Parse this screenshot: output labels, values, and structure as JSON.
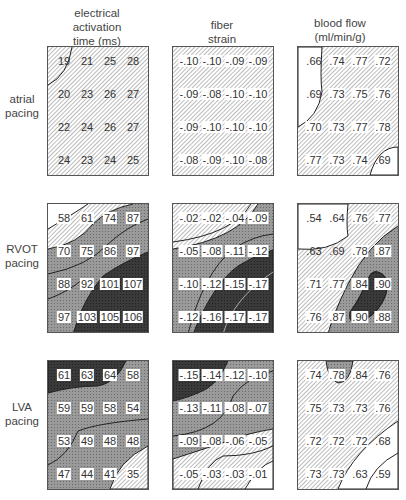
{
  "columns": [
    {
      "title_lines": [
        "electrical",
        "activation",
        "time (ms)"
      ]
    },
    {
      "title_lines": [
        "fiber",
        "strain"
      ]
    },
    {
      "title_lines": [
        "blood flow",
        "(ml/min/g)"
      ]
    }
  ],
  "rows": [
    {
      "label_lines": [
        "atrial",
        "pacing"
      ]
    },
    {
      "label_lines": [
        "RVOT",
        "pacing"
      ]
    },
    {
      "label_lines": [
        "LVA",
        "pacing"
      ]
    }
  ],
  "panels": {
    "atrial_eat": [
      [
        "19",
        "21",
        "25",
        "28"
      ],
      [
        "20",
        "23",
        "26",
        "27"
      ],
      [
        "22",
        "24",
        "26",
        "27"
      ],
      [
        "24",
        "23",
        "24",
        "25"
      ]
    ],
    "atrial_strain": [
      [
        "-.10",
        "-.10",
        "-.09",
        "-.09"
      ],
      [
        "-.09",
        "-.08",
        "-.10",
        "-.10"
      ],
      [
        "-.09",
        "-.10",
        "-.10",
        "-.10"
      ],
      [
        "-.08",
        "-.09",
        "-.10",
        "-.08"
      ]
    ],
    "atrial_flow": [
      [
        ".66",
        ".74",
        ".77",
        ".72"
      ],
      [
        ".69",
        ".73",
        ".75",
        ".76"
      ],
      [
        ".70",
        ".73",
        ".77",
        ".78"
      ],
      [
        ".77",
        ".73",
        ".74",
        ".69"
      ]
    ],
    "rvot_eat": [
      [
        "58",
        "61",
        "74",
        "87"
      ],
      [
        "70",
        "75",
        "86",
        "97"
      ],
      [
        "88",
        "92",
        "101",
        "107"
      ],
      [
        "97",
        "103",
        "105",
        "106"
      ]
    ],
    "rvot_strain": [
      [
        "-.02",
        "-.02",
        "-.04",
        "-.09"
      ],
      [
        "-.05",
        "-.08",
        "-.11",
        "-.12"
      ],
      [
        "-.10",
        "-.12",
        "-.15",
        "-.17"
      ],
      [
        "-.12",
        "-.16",
        "-.17",
        "-.17"
      ]
    ],
    "rvot_flow": [
      [
        ".54",
        ".64",
        ".76",
        ".77"
      ],
      [
        ".63",
        ".69",
        ".78",
        ".87"
      ],
      [
        ".71",
        ".77",
        ".84",
        ".90"
      ],
      [
        ".76",
        ".87",
        ".90",
        ".88"
      ]
    ],
    "lva_eat": [
      [
        "61",
        "63",
        "64",
        "58"
      ],
      [
        "59",
        "59",
        "58",
        "54"
      ],
      [
        "53",
        "49",
        "48",
        "48"
      ],
      [
        "47",
        "44",
        "41",
        "35"
      ]
    ],
    "lva_strain": [
      [
        "-.15",
        "-.14",
        "-.12",
        "-.10"
      ],
      [
        "-.13",
        "-.11",
        "-.08",
        "-.07"
      ],
      [
        "-.09",
        "-.08",
        "-.06",
        "-.05"
      ],
      [
        "-.05",
        "-.03",
        "-.03",
        "-.01"
      ]
    ],
    "lva_flow": [
      [
        ".74",
        ".78",
        ".84",
        ".76"
      ],
      [
        ".75",
        ".73",
        ".73",
        ".76"
      ],
      [
        ".72",
        ".72",
        ".72",
        ".68"
      ],
      [
        ".73",
        ".73",
        ".63",
        ".59"
      ]
    ]
  },
  "chart_data": {
    "type": "heatmap",
    "title": "",
    "column_titles": [
      "electrical activation time (ms)",
      "fiber strain",
      "blood flow (ml/min/g)"
    ],
    "row_titles": [
      "atrial pacing",
      "RVOT pacing",
      "LVA pacing"
    ],
    "grid": "4x4 measurement sites per panel, contour-shaded",
    "series": [
      {
        "name": "atrial pacing / electrical activation time (ms)",
        "values": [
          [
            19,
            21,
            25,
            28
          ],
          [
            20,
            23,
            26,
            27
          ],
          [
            22,
            24,
            26,
            27
          ],
          [
            24,
            23,
            24,
            25
          ]
        ]
      },
      {
        "name": "atrial pacing / fiber strain",
        "values": [
          [
            -0.1,
            -0.1,
            -0.09,
            -0.09
          ],
          [
            -0.09,
            -0.08,
            -0.1,
            -0.1
          ],
          [
            -0.09,
            -0.1,
            -0.1,
            -0.1
          ],
          [
            -0.08,
            -0.09,
            -0.1,
            -0.08
          ]
        ]
      },
      {
        "name": "atrial pacing / blood flow (ml/min/g)",
        "values": [
          [
            0.66,
            0.74,
            0.77,
            0.72
          ],
          [
            0.69,
            0.73,
            0.75,
            0.76
          ],
          [
            0.7,
            0.73,
            0.77,
            0.78
          ],
          [
            0.77,
            0.73,
            0.74,
            0.69
          ]
        ]
      },
      {
        "name": "RVOT pacing / electrical activation time (ms)",
        "values": [
          [
            58,
            61,
            74,
            87
          ],
          [
            70,
            75,
            86,
            97
          ],
          [
            88,
            92,
            101,
            107
          ],
          [
            97,
            103,
            105,
            106
          ]
        ]
      },
      {
        "name": "RVOT pacing / fiber strain",
        "values": [
          [
            -0.02,
            -0.02,
            -0.04,
            -0.09
          ],
          [
            -0.05,
            -0.08,
            -0.11,
            -0.12
          ],
          [
            -0.1,
            -0.12,
            -0.15,
            -0.17
          ],
          [
            -0.12,
            -0.16,
            -0.17,
            -0.17
          ]
        ]
      },
      {
        "name": "RVOT pacing / blood flow (ml/min/g)",
        "values": [
          [
            0.54,
            0.64,
            0.76,
            0.77
          ],
          [
            0.63,
            0.69,
            0.78,
            0.87
          ],
          [
            0.71,
            0.77,
            0.84,
            0.9
          ],
          [
            0.76,
            0.87,
            0.9,
            0.88
          ]
        ]
      },
      {
        "name": "LVA pacing / electrical activation time (ms)",
        "values": [
          [
            61,
            63,
            64,
            58
          ],
          [
            59,
            59,
            58,
            54
          ],
          [
            53,
            49,
            48,
            48
          ],
          [
            47,
            44,
            41,
            35
          ]
        ]
      },
      {
        "name": "LVA pacing / fiber strain",
        "values": [
          [
            -0.15,
            -0.14,
            -0.12,
            -0.1
          ],
          [
            -0.13,
            -0.11,
            -0.08,
            -0.07
          ],
          [
            -0.09,
            -0.08,
            -0.06,
            -0.05
          ],
          [
            -0.05,
            -0.03,
            -0.03,
            -0.01
          ]
        ]
      },
      {
        "name": "LVA pacing / blood flow (ml/min/g)",
        "values": [
          [
            0.74,
            0.78,
            0.84,
            0.76
          ],
          [
            0.75,
            0.73,
            0.73,
            0.76
          ],
          [
            0.72,
            0.72,
            0.72,
            0.68
          ],
          [
            0.73,
            0.73,
            0.63,
            0.59
          ]
        ]
      }
    ]
  }
}
